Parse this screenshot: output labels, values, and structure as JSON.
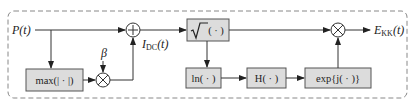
{
  "diagram": {
    "input_label": "P(t)",
    "input_label_main": "P",
    "input_label_arg": "(t)",
    "beta_label": "β",
    "idc_label_main": "I",
    "idc_label_sub": "DC",
    "idc_label_arg": "(t)",
    "output_label_main": "E",
    "output_label_sub": "KK",
    "output_label_arg": "(t)",
    "blocks": {
      "max": "max(| · |)",
      "sqrt_arg": "( · )",
      "ln": "ln( · )",
      "h": "H( · )",
      "exp": "exp{j( · )}"
    },
    "operators": {
      "sum": "+",
      "mult1": "×",
      "mult2": "×"
    },
    "colors": {
      "block_fill": "#dcdcdc",
      "block_stroke": "#555555",
      "line": "#333333",
      "dash_border": "#888888"
    }
  }
}
